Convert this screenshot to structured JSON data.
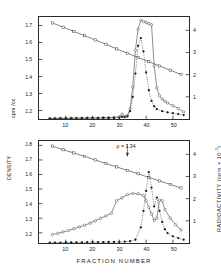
{
  "figure": {
    "xlabel": "FRACTION NUMBER",
    "right_axis_label": "RADIOACTIVITY  (cpm × 10",
    "right_axis_exp": "-3",
    "right_axis_label_close": ")",
    "left_axis_label_a": "cpm /cc",
    "left_axis_label_b": "DENSITY",
    "panel_a_letter": "a",
    "panel_b_letter": "b",
    "rho_annotation": "ρ = 1.34"
  },
  "chart_data": [
    {
      "type": "line",
      "id": "panel-a",
      "title": "a",
      "xlabel": "FRACTION NUMBER",
      "ylabel": "cpm /cc",
      "y2label": "RADIOACTIVITY (cpm x 10^-3)",
      "xlim": [
        0,
        56
      ],
      "ylim": [
        1.15,
        1.75
      ],
      "y2lim": [
        0,
        4.6
      ],
      "xticks": [
        10,
        20,
        30,
        40,
        50
      ],
      "yticks": [
        "1.7",
        "1.6",
        "1.5",
        "1.4",
        "1.3",
        "1.2"
      ],
      "ytick_values": [
        1.7,
        1.6,
        1.5,
        1.4,
        1.3,
        1.2
      ],
      "y2ticks": [
        "4",
        "3",
        "2",
        "1"
      ],
      "y2tick_values": [
        4,
        3,
        2,
        1
      ],
      "grid": false,
      "legend": "none",
      "series": [
        {
          "name": "density gradient",
          "marker": "open-square",
          "axis": "left",
          "x": [
            5,
            9,
            13,
            17,
            21,
            25,
            29,
            33,
            37,
            41,
            45,
            49,
            53
          ],
          "values": [
            1.715,
            1.69,
            1.665,
            1.64,
            1.615,
            1.59,
            1.562,
            1.537,
            1.512,
            1.487,
            1.462,
            1.437,
            1.412
          ]
        },
        {
          "name": "radioactivity open circles",
          "marker": "open-circle",
          "axis": "right",
          "x": [
            4,
            6,
            8,
            10,
            12,
            14,
            16,
            18,
            20,
            22,
            24,
            26,
            28,
            30,
            31,
            32,
            33,
            34,
            35,
            36,
            37,
            38,
            39,
            40,
            41,
            42,
            43,
            44,
            45,
            46,
            47,
            48,
            50,
            52,
            54
          ],
          "values": [
            0.02,
            0.03,
            0.03,
            0.03,
            0.04,
            0.04,
            0.04,
            0.05,
            0.05,
            0.05,
            0.06,
            0.06,
            0.07,
            0.1,
            0.22,
            0.12,
            0.15,
            0.45,
            1.45,
            3.1,
            4.05,
            4.45,
            4.4,
            4.35,
            4.3,
            4.25,
            2.4,
            1.4,
            1.05,
            0.9,
            0.8,
            0.72,
            0.6,
            0.48,
            0.32
          ]
        },
        {
          "name": "radioactivity filled circles",
          "marker": "filled-circle",
          "axis": "right",
          "x": [
            4,
            6,
            8,
            10,
            12,
            14,
            16,
            18,
            20,
            22,
            24,
            26,
            28,
            30,
            31,
            32,
            33,
            34,
            35,
            36,
            37,
            38,
            39,
            40,
            41,
            42,
            43,
            44,
            46,
            48,
            50,
            52,
            54
          ],
          "values": [
            0.02,
            0.02,
            0.03,
            0.03,
            0.03,
            0.03,
            0.04,
            0.04,
            0.04,
            0.04,
            0.05,
            0.05,
            0.05,
            0.06,
            0.1,
            0.08,
            0.12,
            0.35,
            1.0,
            2.05,
            3.3,
            3.65,
            3.05,
            2.1,
            1.3,
            0.82,
            0.58,
            0.45,
            0.35,
            0.3,
            0.26,
            0.22,
            0.18
          ]
        }
      ]
    },
    {
      "type": "line",
      "id": "panel-b",
      "title": "b",
      "xlabel": "FRACTION NUMBER",
      "ylabel": "DENSITY",
      "y2label": "RADIOACTIVITY (cpm x 10^-3)",
      "xlim": [
        0,
        56
      ],
      "ylim": [
        1.13,
        1.83
      ],
      "y2lim": [
        0,
        4.6
      ],
      "xticks": [
        10,
        20,
        30,
        40,
        50
      ],
      "yticks": [
        "1.8",
        "1.7",
        "1.6",
        "1.5",
        "1.4",
        "1.3",
        "1.2"
      ],
      "ytick_values": [
        1.8,
        1.7,
        1.6,
        1.5,
        1.4,
        1.3,
        1.2
      ],
      "y2ticks": [
        "4",
        "3",
        "2",
        "1"
      ],
      "y2tick_values": [
        4,
        3,
        2,
        1
      ],
      "grid": false,
      "legend": "none",
      "annotations": [
        {
          "text": "ρ = 1.34",
          "x": 33,
          "y_axis": "left",
          "arrow": "down"
        }
      ],
      "series": [
        {
          "name": "density gradient line",
          "marker": "open-square",
          "axis": "left",
          "x": [
            5,
            9,
            13,
            17,
            21,
            25,
            29,
            33,
            37,
            41,
            45,
            49,
            53
          ],
          "values": [
            1.795,
            1.77,
            1.748,
            1.725,
            1.7,
            1.675,
            1.652,
            1.628,
            1.605,
            1.58,
            1.556,
            1.532,
            1.508
          ]
        },
        {
          "name": "refractive density profile",
          "marker": "open-circle",
          "axis": "left",
          "x": [
            5,
            7,
            9,
            11,
            13,
            15,
            17,
            19,
            21,
            23,
            25,
            27,
            29,
            31,
            33,
            35,
            37,
            39,
            40,
            41,
            42,
            43,
            44,
            45,
            46,
            47,
            49,
            51,
            53
          ],
          "values": [
            1.188,
            1.196,
            1.206,
            1.216,
            1.228,
            1.24,
            1.252,
            1.266,
            1.282,
            1.3,
            1.316,
            1.334,
            1.42,
            1.44,
            1.462,
            1.47,
            1.468,
            1.455,
            1.42,
            1.375,
            1.33,
            1.285,
            1.3,
            1.425,
            1.42,
            1.36,
            1.3,
            1.255,
            1.22
          ]
        },
        {
          "name": "radioactivity filled circles",
          "marker": "filled-circle",
          "axis": "right",
          "x": [
            4,
            6,
            8,
            10,
            12,
            14,
            16,
            18,
            20,
            22,
            24,
            26,
            28,
            30,
            32,
            34,
            36,
            38,
            39,
            40,
            41,
            42,
            43,
            44,
            45,
            46,
            47,
            48,
            50,
            52,
            54
          ],
          "values": [
            0.02,
            0.02,
            0.02,
            0.03,
            0.03,
            0.03,
            0.03,
            0.04,
            0.04,
            0.04,
            0.04,
            0.05,
            0.05,
            0.05,
            0.06,
            0.08,
            0.15,
            0.7,
            1.45,
            2.35,
            3.2,
            2.5,
            1.65,
            2.05,
            1.45,
            0.95,
            0.62,
            0.45,
            0.3,
            0.22,
            0.15
          ]
        }
      ]
    }
  ]
}
